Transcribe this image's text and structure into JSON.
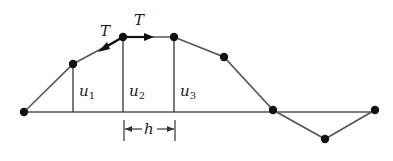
{
  "diagram": {
    "axis": {
      "x_start": 24,
      "x_end": 375,
      "y": 112,
      "color": "#555555"
    },
    "points": [
      {
        "x": 24,
        "y": 112
      },
      {
        "x": 73,
        "y": 64
      },
      {
        "x": 123,
        "y": 37
      },
      {
        "x": 174,
        "y": 37
      },
      {
        "x": 224,
        "y": 57
      },
      {
        "x": 273,
        "y": 110
      },
      {
        "x": 325,
        "y": 139
      },
      {
        "x": 375,
        "y": 110
      }
    ],
    "displacement_labels": [
      {
        "base": "u",
        "sub": "1"
      },
      {
        "base": "u",
        "sub": "2"
      },
      {
        "base": "u",
        "sub": "3"
      }
    ],
    "tension_labels": [
      "T",
      "T"
    ],
    "spacing_label": "h",
    "colors": {
      "line": "#555555",
      "node": "#111111",
      "text": "#1a1a1a"
    }
  }
}
